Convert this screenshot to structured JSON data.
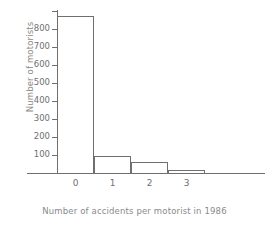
{
  "chart_data": {
    "type": "bar",
    "title": "",
    "xlabel": "Number of accidents per motorist in 1986",
    "ylabel": "Number of motorists",
    "categories": [
      "0",
      "1",
      "2",
      "3"
    ],
    "values": [
      870,
      95,
      60,
      15
    ],
    "ylim": [
      0,
      900
    ],
    "xlim": [
      -0.5,
      3.5
    ],
    "yticks": [
      100,
      200,
      300,
      400,
      500,
      600,
      700,
      800
    ],
    "ytick_labels": [
      "100",
      "200",
      "300",
      "400",
      "500",
      "600",
      "700",
      "800"
    ],
    "xtick_labels": [
      "0",
      "1",
      "2",
      "3"
    ],
    "grid": false,
    "legend": null,
    "bar_style": "outline",
    "bar_edge_color": "#6f6f6f",
    "bar_fill_color": "transparent",
    "axis_color": "#6f6f6f",
    "label_color": "#8a8a8a",
    "background": "#ffffff"
  }
}
